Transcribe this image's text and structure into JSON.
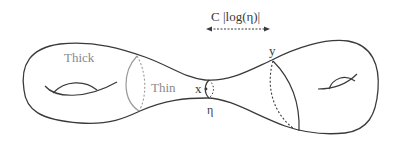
{
  "figure": {
    "type": "surface-degeneration-diagram",
    "labels": {
      "thick": "Thick",
      "thin": "Thin",
      "point_x": "x",
      "point_y": "y",
      "eta": "η",
      "distance": "C |log(η)|"
    },
    "colors": {
      "outline": "#3a3a3a",
      "thick_thin_boundary": "#9a9a9a",
      "label_gray": "#8a8a8a",
      "label_dark": "#3a3a3a",
      "background": "#ffffff"
    }
  }
}
